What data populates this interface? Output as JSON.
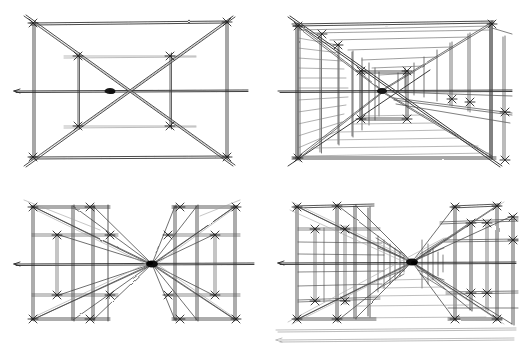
{
  "sheet": {
    "title": "One-point perspective construction studies",
    "medium": "graphite and ink line drawing on white paper",
    "width": 528,
    "height": 350,
    "background_color": "#ffffff",
    "ink_color": "#222222",
    "light_ink_color": "#8a8a8a",
    "layout": "2 x 2 grid of sketches, no captions or labels",
    "visible_text": ""
  },
  "panels": [
    {
      "id": "top-left",
      "name": "basic-one-point-frame",
      "description": "Rectangular picture frame with horizon line, two full diagonals crossing at the central vanishing point, two vertical intermediate uprights with tick marks, and two light horizontal rails above and below the horizon.",
      "origin": [
        0,
        0
      ],
      "size": [
        264,
        175
      ],
      "vanishing_point": [
        110,
        91
      ],
      "horizon_y": 91,
      "frame": {
        "left": 32,
        "right": 228,
        "top": 22,
        "bottom": 158
      }
    },
    {
      "id": "top-right",
      "name": "corridor-colonnade-perspective",
      "description": "Same frame developed into a deep corridor: repeated vertical posts on both side walls receding to the vanishing point, ceiling beams, floor boards and a long diagonal guide line sweeping from upper left to lower right.",
      "origin": [
        264,
        0
      ],
      "size": [
        264,
        175
      ],
      "vanishing_point": [
        382,
        91
      ],
      "horizon_y": 91,
      "frame": {
        "left": 296,
        "right": 492,
        "top": 22,
        "bottom": 158
      }
    },
    {
      "id": "bottom-left",
      "name": "split-bay-radial-construction",
      "description": "Two separated rectangular bays, left and right of a central vanishing point on the horizon, with radiating convergence lines from every bay corner and intermediate upright to the single vanishing point.",
      "origin": [
        0,
        175
      ],
      "size": [
        264,
        175
      ],
      "vanishing_point": [
        152,
        264
      ],
      "horizon_y": 264,
      "frame": {
        "left": 28,
        "right": 236,
        "top": 205,
        "bottom": 320
      }
    },
    {
      "id": "bottom-right",
      "name": "dense-structural-bay-study",
      "description": "Most developed study: layered scaffolding-like bays with many closely spaced uprights and rails compressing toward the vanishing point, plus loose ground lines sketched below the frame.",
      "origin": [
        264,
        175
      ],
      "size": [
        264,
        175
      ],
      "vanishing_point": [
        412,
        262
      ],
      "horizon_y": 262,
      "frame": {
        "left": 292,
        "right": 500,
        "top": 205,
        "bottom": 320
      }
    }
  ],
  "annotations": {
    "tick_marks": "short crossing strokes at every post/beam intersection",
    "labels": [],
    "captions": []
  }
}
